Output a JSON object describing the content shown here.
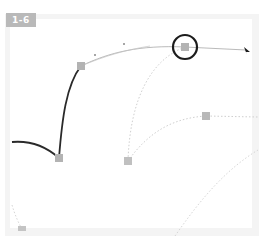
{
  "figure": {
    "label": "1-6"
  },
  "canvas": {
    "background": "#ffffff",
    "frame_color": "#f4f4f4"
  },
  "colors": {
    "path_stroke": "#2a2a2a",
    "handle_line": "#b0b0b0",
    "guide_dotted": "#c8c8c8",
    "anchor_fill": "#b3b3b3",
    "highlight_circle": "#1c1c1c",
    "badge": "#b9b9b9"
  },
  "elements": {
    "anchors": [
      {
        "name": "anchor-corner",
        "x": 59,
        "y": 158
      },
      {
        "name": "anchor-top",
        "x": 81,
        "y": 66
      },
      {
        "name": "anchor-selected",
        "x": 185,
        "y": 47
      },
      {
        "name": "anchor-middle",
        "x": 128,
        "y": 161
      },
      {
        "name": "anchor-right",
        "x": 206,
        "y": 116
      },
      {
        "name": "anchor-bottom-left",
        "x": 22,
        "y": 229
      }
    ],
    "pointer": {
      "x": 246,
      "y": 51
    }
  }
}
